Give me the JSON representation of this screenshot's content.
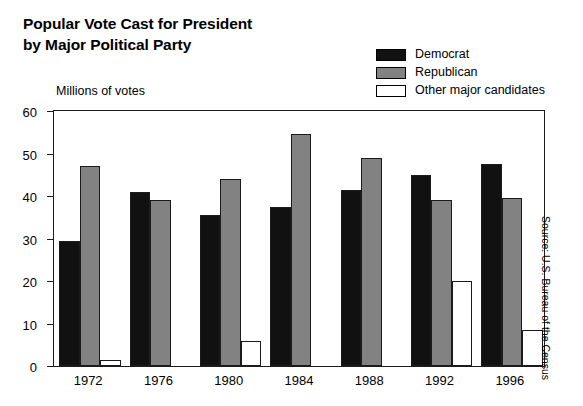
{
  "chart_data": {
    "type": "bar",
    "title": "Popular Vote Cast for President by Major Political Party",
    "title_lines": [
      "Popular Vote Cast for President",
      "by Major Political Party"
    ],
    "xlabel": "",
    "ylabel": "Millions of votes",
    "ylim": [
      0,
      60
    ],
    "yticks": [
      0,
      10,
      20,
      30,
      40,
      50,
      60
    ],
    "ytick_labels": [
      "0",
      "10",
      "20",
      "30",
      "40",
      "50",
      "60"
    ],
    "grid": false,
    "legend_position": "top-right",
    "categories": [
      "1972",
      "1976",
      "1980",
      "1984",
      "1988",
      "1992",
      "1996"
    ],
    "series": [
      {
        "name": "Democrat",
        "color": "#111111",
        "values": [
          29.5,
          41.0,
          35.5,
          37.5,
          41.5,
          45.0,
          47.5
        ]
      },
      {
        "name": "Republican",
        "color": "#828282",
        "values": [
          47.0,
          39.0,
          44.0,
          54.5,
          49.0,
          39.0,
          39.5
        ]
      },
      {
        "name": "Other major candidates",
        "color": "#ffffff",
        "values": [
          1.5,
          0,
          6.0,
          0,
          0,
          20.0,
          8.5
        ]
      }
    ],
    "annotations": [
      "Source: U.S. Bureau of the Census"
    ]
  },
  "legend": {
    "items": [
      {
        "label": "Democrat"
      },
      {
        "label": "Republican"
      },
      {
        "label": "Other major candidates"
      }
    ]
  },
  "source": {
    "text": "Source: U.S. Bureau of the Census"
  }
}
